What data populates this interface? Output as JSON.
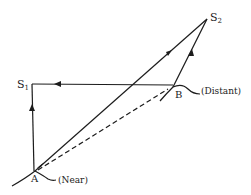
{
  "diagram": {
    "points": {
      "A": {
        "label": "A",
        "note": "(Near)"
      },
      "B": {
        "label": "B",
        "note": "(Distant)"
      },
      "S1": {
        "label": "S",
        "sub": "1"
      },
      "S2": {
        "label": "S",
        "sub": "2"
      }
    },
    "paths": [
      {
        "from": "A",
        "to": "S2",
        "style": "solid",
        "arrow": "toward S2"
      },
      {
        "from": "B",
        "to": "S2",
        "style": "solid",
        "arrow": "toward S2"
      },
      {
        "from": "B",
        "to": "S1",
        "style": "solid",
        "arrow": "toward S1"
      },
      {
        "from": "A",
        "to": "S1",
        "style": "solid",
        "arrow": "toward S1"
      },
      {
        "from": "A",
        "to": "B",
        "style": "dashed",
        "arrow": "none"
      }
    ],
    "colors": {
      "line": "#1c1c1c",
      "background": "#ffffff"
    }
  }
}
